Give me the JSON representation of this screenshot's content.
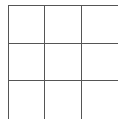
{
  "board": {
    "rows": 3,
    "cols": 3,
    "line_color": "#555555",
    "cells": [
      [
        "",
        "",
        ""
      ],
      [
        "",
        "",
        ""
      ],
      [
        "",
        "",
        ""
      ]
    ]
  }
}
